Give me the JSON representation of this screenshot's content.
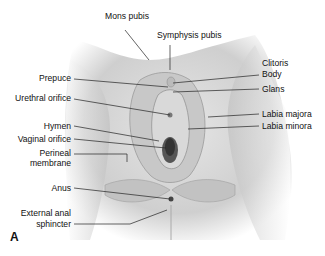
{
  "figure": {
    "panel_letter": "A",
    "labels": {
      "mons_pubis": "Mons pubis",
      "symphysis_pubis": "Symphysis pubis",
      "clitoris": "Clitoris",
      "body": "Body",
      "glans": "Glans",
      "prepuce": "Prepuce",
      "urethral_orifice": "Urethral orifice",
      "labia_majora": "Labia majora",
      "labia_minora": "Labia minora",
      "hymen": "Hymen",
      "vaginal_orifice": "Vaginal orifice",
      "perineal_membrane_1": "Perineal",
      "perineal_membrane_2": "membrane",
      "anus": "Anus",
      "external_anal_sphincter_1": "External anal",
      "external_anal_sphincter_2": "sphincter"
    }
  }
}
